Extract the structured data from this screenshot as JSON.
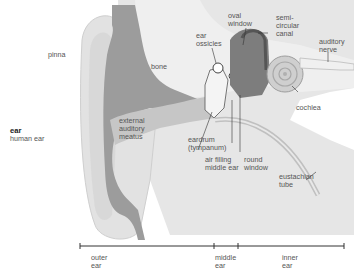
{
  "entry": {
    "title": "ear",
    "subtitle": "human ear"
  },
  "labels": {
    "pinna": "pinna",
    "bone": "bone",
    "ear_ossicles": "ear\nossicles",
    "oval_window": "oval\nwindow",
    "semicircular_canal": "semi-\ncircular\ncanal",
    "auditory_nerve": "auditory\nnerve",
    "cochlea": "cochlea",
    "external_auditory_meatus": "external\nauditory\nmeatus",
    "eardrum": "eardrum\n(tympanum)",
    "air_filling_middle_ear": "air filling\nmiddle ear",
    "round_window": "round\nwindow",
    "eustachian_tube": "eustachian\ntube"
  },
  "sections": [
    {
      "label": "outer\near"
    },
    {
      "label": "middle\near"
    },
    {
      "label": "inner\near"
    }
  ],
  "colors": {
    "background": "#ffffff",
    "skin_light": "#e8e8e8",
    "skin_mid": "#d6d6d6",
    "bone": "#ececec",
    "cartilage_dark": "#9a9a9a",
    "canal": "#c4c4c4",
    "inner_dark": "#7c7c7c",
    "line": "#333333",
    "text": "#555555"
  }
}
